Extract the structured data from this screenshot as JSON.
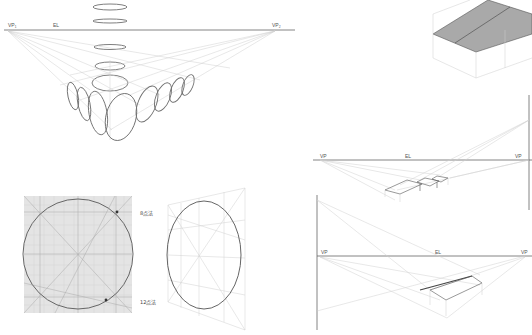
{
  "figure": {
    "panel_ellipses": {
      "vp_left_label": "VP₁",
      "eye_level_label": "EL",
      "vp_right_label": "VP₂"
    },
    "panel_roof_box": {},
    "panel_circle_square": {
      "method_8_label": "8点法",
      "method_12_label": "12点法"
    },
    "panel_ellipse_perspective": {},
    "panel_steps": {
      "vp_left_label": "VP",
      "eye_level_label": "EL",
      "vp_right_label": "VP"
    },
    "panel_slope": {
      "vp_left_label": "VP",
      "eye_level_label": "EL",
      "vp_right_label": "VP"
    },
    "colors": {
      "line": "#666666",
      "guide": "#d0d0d0",
      "roof_fill": "#a9a9a9",
      "grid_fill": "#e4e4e4"
    }
  }
}
